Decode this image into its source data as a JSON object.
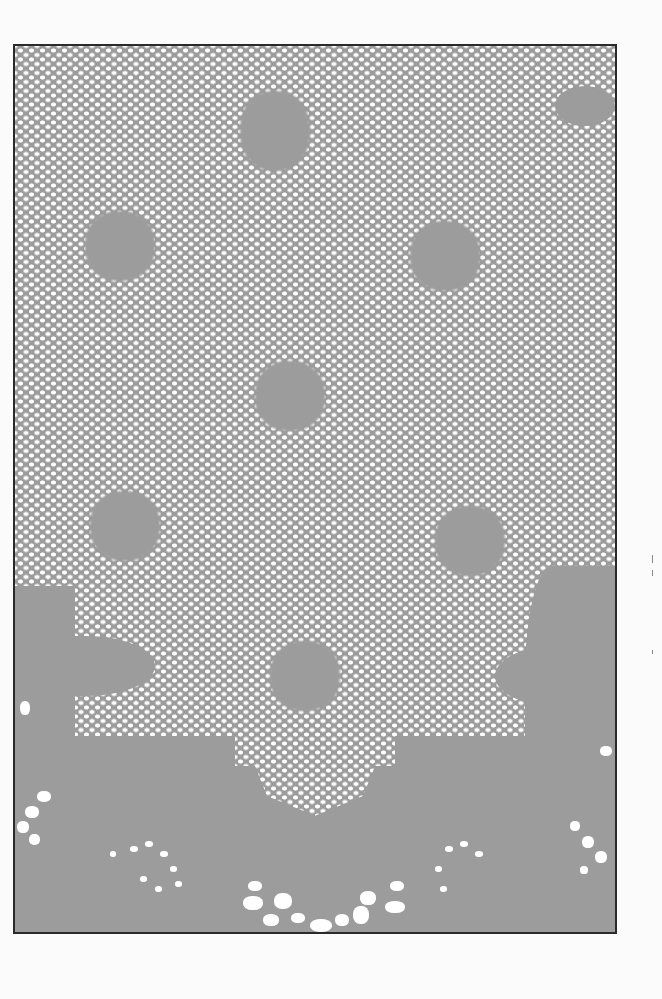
{
  "image": {
    "subject": "lace fabric with mesh ground and floral motifs",
    "colors": {
      "background": "#fbfbfb",
      "fabric": "#9c9c9c",
      "holes": "#ffffff",
      "frame": "#2a2a2a"
    },
    "motifs": [
      {
        "x": 262,
        "y": 110
      },
      {
        "x": 113,
        "y": 235
      },
      {
        "x": 440,
        "y": 250
      },
      {
        "x": 285,
        "y": 390
      },
      {
        "x": 120,
        "y": 520
      },
      {
        "x": 465,
        "y": 535
      },
      {
        "x": 300,
        "y": 670
      }
    ]
  }
}
